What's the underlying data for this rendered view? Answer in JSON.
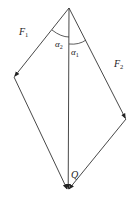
{
  "diagram": {
    "type": "force-vector-parallelogram",
    "labels": {
      "f1": {
        "main": "F",
        "sub": "1"
      },
      "f2": {
        "main": "F",
        "sub": "2"
      },
      "alpha2": {
        "main": "α",
        "sub": "2"
      },
      "alpha1": {
        "main": "α",
        "sub": "1"
      },
      "q": {
        "main": "Q"
      }
    },
    "colors": {
      "line": "#333333",
      "background": "#ffffff"
    }
  }
}
